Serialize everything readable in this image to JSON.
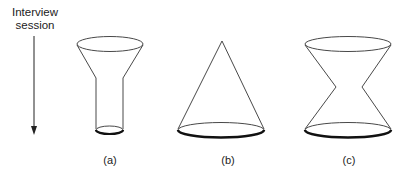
{
  "axis": {
    "label_line1": "Interview",
    "label_line2": "session",
    "direction": "down"
  },
  "shapes": [
    {
      "id": "a",
      "label": "(a)",
      "shape": "funnel"
    },
    {
      "id": "b",
      "label": "(b)",
      "shape": "cone"
    },
    {
      "id": "c",
      "label": "(c)",
      "shape": "hourglass"
    }
  ],
  "colors": {
    "stroke": "#333333",
    "shadow": "#1a1a1a",
    "background": "#ffffff"
  }
}
